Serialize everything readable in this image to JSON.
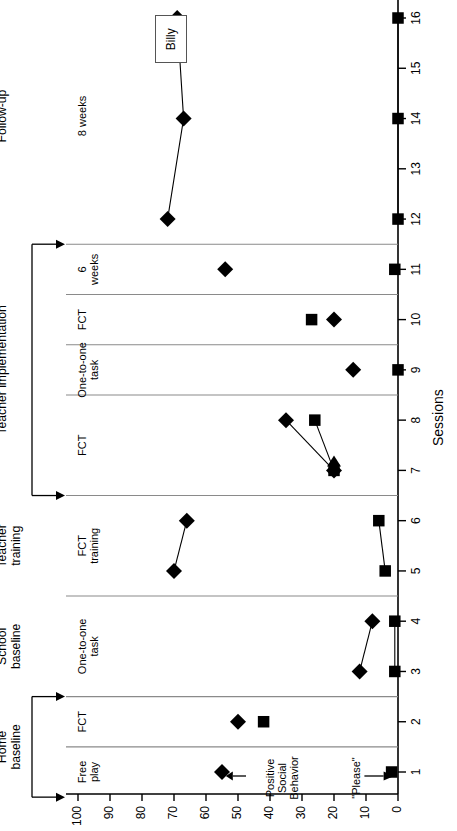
{
  "figure": {
    "subject_label": "Billy",
    "x_axis_title": "Sessions",
    "y_axis_title": "",
    "annotations": [
      {
        "name": "positive-social-behavior",
        "text": "Positive\nSocial\nBehavior"
      },
      {
        "name": "please",
        "text": "\"Please\""
      }
    ]
  },
  "phases": [
    {
      "name": "home-baseline",
      "title": "Home\nbaseline",
      "start": 0.5,
      "end": 2.5
    },
    {
      "name": "school-baseline",
      "title": "School\nbaseline",
      "start": 2.5,
      "end": 4.5
    },
    {
      "name": "teacher-training",
      "title": "Teacher\ntraining",
      "start": 4.5,
      "end": 6.5
    },
    {
      "name": "teacher-implementation",
      "title": "Teacher implementation",
      "start": 6.5,
      "end": 11.5
    },
    {
      "name": "follow-up",
      "title": "Follow-up",
      "start": 11.5,
      "end": 16.6
    }
  ],
  "conditions": [
    {
      "name": "free-play",
      "label": "Free\nplay",
      "start": 0.5,
      "end": 1.5
    },
    {
      "name": "fct-home",
      "label": "FCT",
      "start": 1.5,
      "end": 2.5
    },
    {
      "name": "one-to-one-a",
      "label": "One-to-one\ntask",
      "start": 2.5,
      "end": 4.5
    },
    {
      "name": "fct-training",
      "label": "FCT\ntraining",
      "start": 4.5,
      "end": 6.5
    },
    {
      "name": "fct-impl-1",
      "label": "FCT",
      "start": 6.5,
      "end": 8.5
    },
    {
      "name": "one-to-one-b",
      "label": "One-to-one\ntask",
      "start": 8.5,
      "end": 9.5
    },
    {
      "name": "fct-impl-2",
      "label": "FCT",
      "start": 9.5,
      "end": 10.5
    },
    {
      "name": "six-weeks",
      "label": "6\nweeks",
      "start": 10.5,
      "end": 11.5
    },
    {
      "name": "eight-weeks",
      "label": "8 weeks",
      "start": 11.5,
      "end": 16.6
    }
  ],
  "chart_data": {
    "type": "line",
    "title": "",
    "xlabel": "Sessions",
    "ylabel": "",
    "xlim": [
      0.4,
      16.6
    ],
    "ylim": [
      0,
      100
    ],
    "grid": false,
    "legend": "Billy",
    "x": [
      1,
      2,
      3,
      4,
      5,
      6,
      7,
      8,
      9,
      10,
      11,
      12,
      14,
      16
    ],
    "xticks": [
      1,
      2,
      3,
      4,
      5,
      6,
      7,
      8,
      9,
      10,
      11,
      12,
      13,
      14,
      15,
      16
    ],
    "yticks": [
      0,
      10,
      20,
      30,
      40,
      50,
      60,
      70,
      80,
      90,
      100
    ],
    "series": [
      {
        "name": "Positive Social Behavior",
        "marker": "diamond",
        "color": "#000000",
        "values": [
          55,
          50,
          12,
          8,
          70,
          66,
          20,
          35,
          14,
          20,
          54,
          72,
          67,
          69
        ],
        "segments": [
          [
            1
          ],
          [
            2
          ],
          [
            3,
            4
          ],
          [
            5,
            6
          ],
          [
            7,
            8
          ],
          [
            9
          ],
          [
            10
          ],
          [
            11
          ],
          [
            12,
            14,
            16
          ]
        ]
      },
      {
        "name": "\"Please\"",
        "marker": "square",
        "color": "#000000",
        "values": [
          2,
          42,
          1,
          1,
          4,
          6,
          20,
          26,
          0,
          27,
          1,
          0,
          0,
          0
        ],
        "segments": [
          [
            1
          ],
          [
            2
          ],
          [
            3,
            4
          ],
          [
            5,
            6
          ],
          [
            7,
            8
          ],
          [
            9
          ],
          [
            10
          ],
          [
            11
          ],
          [
            12,
            14,
            16
          ]
        ]
      }
    ]
  },
  "axis_tick_labels": {
    "y": [
      "0",
      "10",
      "20",
      "30",
      "40",
      "50",
      "60",
      "70",
      "80",
      "90",
      "100"
    ],
    "x": [
      "1",
      "2",
      "3",
      "4",
      "5",
      "6",
      "7",
      "8",
      "9",
      "10",
      "11",
      "12",
      "13",
      "14",
      "15",
      "16"
    ]
  }
}
